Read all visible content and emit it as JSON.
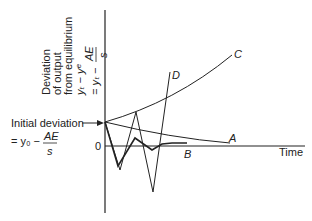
{
  "diagram": {
    "y_axis_label": {
      "lines": [
        "Deviation",
        "of output",
        "from equilibrium"
      ],
      "formula1": "yₜ − yᵉ",
      "formula2_prefix": "= yₜ −",
      "formula2_num": "AE",
      "formula2_den": "s"
    },
    "x_axis_label": "Time",
    "zero_label": "0",
    "initial": {
      "label": "Initial deviation",
      "formula_prefix": "= y₀ −",
      "formula_num": "AE",
      "formula_den": "s"
    },
    "curves": [
      {
        "name": "A",
        "label": "A"
      },
      {
        "name": "B",
        "label": "B"
      },
      {
        "name": "C",
        "label": "C"
      },
      {
        "name": "D",
        "label": "D"
      }
    ]
  }
}
